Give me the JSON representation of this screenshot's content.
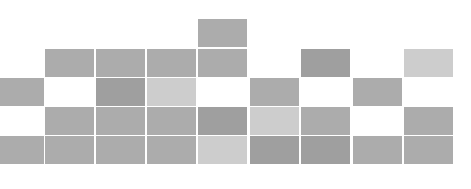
{
  "grid": {
    "columns_x": [
      -5,
      45,
      96,
      147,
      198,
      250,
      301,
      353,
      404
    ],
    "column_width": 49,
    "rows_y": [
      19,
      49,
      78,
      107,
      136
    ],
    "row_height": 28,
    "palette": {
      "dark": "#9f9f9f",
      "medium": "#acacac",
      "light": "#cdcdcd"
    },
    "cells": [
      {
        "row": 0,
        "col": 4,
        "shade": "medium"
      },
      {
        "row": 1,
        "col": 1,
        "shade": "medium"
      },
      {
        "row": 1,
        "col": 2,
        "shade": "medium"
      },
      {
        "row": 1,
        "col": 3,
        "shade": "medium"
      },
      {
        "row": 1,
        "col": 4,
        "shade": "medium"
      },
      {
        "row": 1,
        "col": 6,
        "shade": "dark"
      },
      {
        "row": 1,
        "col": 8,
        "shade": "light"
      },
      {
        "row": 2,
        "col": 0,
        "shade": "medium"
      },
      {
        "row": 2,
        "col": 2,
        "shade": "dark"
      },
      {
        "row": 2,
        "col": 3,
        "shade": "light"
      },
      {
        "row": 2,
        "col": 5,
        "shade": "medium"
      },
      {
        "row": 2,
        "col": 7,
        "shade": "medium"
      },
      {
        "row": 3,
        "col": 1,
        "shade": "medium"
      },
      {
        "row": 3,
        "col": 2,
        "shade": "medium"
      },
      {
        "row": 3,
        "col": 3,
        "shade": "medium"
      },
      {
        "row": 3,
        "col": 4,
        "shade": "dark"
      },
      {
        "row": 3,
        "col": 5,
        "shade": "light"
      },
      {
        "row": 3,
        "col": 6,
        "shade": "medium"
      },
      {
        "row": 3,
        "col": 8,
        "shade": "medium"
      },
      {
        "row": 4,
        "col": 0,
        "shade": "medium"
      },
      {
        "row": 4,
        "col": 1,
        "shade": "medium"
      },
      {
        "row": 4,
        "col": 2,
        "shade": "medium"
      },
      {
        "row": 4,
        "col": 3,
        "shade": "medium"
      },
      {
        "row": 4,
        "col": 4,
        "shade": "light"
      },
      {
        "row": 4,
        "col": 5,
        "shade": "dark"
      },
      {
        "row": 4,
        "col": 6,
        "shade": "dark"
      },
      {
        "row": 4,
        "col": 7,
        "shade": "medium"
      },
      {
        "row": 4,
        "col": 8,
        "shade": "medium"
      }
    ]
  }
}
